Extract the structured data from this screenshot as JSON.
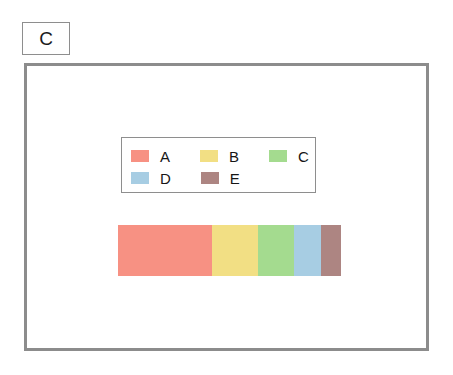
{
  "panel": {
    "label": "C"
  },
  "legend": {
    "rows": [
      [
        {
          "label": "A",
          "color": "#F79183"
        },
        {
          "label": "B",
          "color": "#F2DF84"
        },
        {
          "label": "C",
          "color": "#A4DB8F"
        }
      ],
      [
        {
          "label": "D",
          "color": "#A7CDE3"
        },
        {
          "label": "E",
          "color": "#AD8582"
        }
      ]
    ],
    "border_color": "#8e8e8e"
  },
  "frame": {
    "border_color": "#8c8c8c",
    "background": "#ffffff"
  },
  "chart_data": {
    "type": "bar",
    "orientation": "horizontal",
    "stacked": true,
    "title": "C",
    "xlabel": "",
    "ylabel": "",
    "grid": false,
    "legend_position": "upper-center",
    "categories": [
      "A",
      "B",
      "C",
      "D",
      "E"
    ],
    "series": [
      {
        "name": "proportion",
        "values": [
          42.2,
          20.6,
          16.1,
          12.1,
          9.0
        ]
      }
    ],
    "colors": [
      "#F79183",
      "#F2DF84",
      "#A4DB8F",
      "#A7CDE3",
      "#AD8582"
    ],
    "units": "percent",
    "xlim": [
      0,
      100
    ],
    "tick_labels": []
  }
}
